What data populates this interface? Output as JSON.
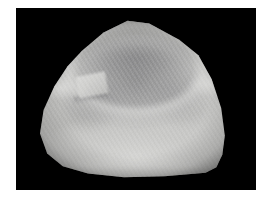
{
  "figure": {
    "domain": "Natural-Image",
    "kind": "grayscale-3d-surface-scan",
    "caption": "",
    "label": "",
    "page_background_color": "#ffffff",
    "frame": {
      "background_color": "#000000",
      "x": 16,
      "y": 8,
      "width": 240,
      "height": 182,
      "border_color": "#ffffff"
    },
    "image_size": {
      "width": 267,
      "height": 203
    },
    "palette": {
      "background": "#000000",
      "specimen_highlight": "#d8d8d6",
      "specimen_midtone": "#c2c2c0",
      "specimen_shadow": "#8c8c8e",
      "cavity_shadow": "#7a7a7c",
      "border": "#ffffff"
    },
    "features": [
      {
        "name": "apex-vertex",
        "description": "upper vertex of the faceted outline"
      },
      {
        "name": "impression-cavity",
        "description": "dark concave arch-shaped depression in the upper centre"
      },
      {
        "name": "rim-ridge",
        "description": "bright raised crest surrounding the cavity"
      },
      {
        "name": "left-notch-tab",
        "description": "small rectangular ledge on the upper-left flank"
      },
      {
        "name": "right-shoulder-facet",
        "description": "flat bright facet on the upper-right flank"
      },
      {
        "name": "base-rim",
        "description": "bright rounded lower border of the cast"
      },
      {
        "name": "scan-striations",
        "description": "fine diagonal corduroy texture from the surface scanner"
      }
    ],
    "texture": {
      "type": "diagonal-striations",
      "angle_degrees": 58,
      "period_px": 4
    },
    "annotations": [],
    "axis_labels": [],
    "legend": []
  }
}
